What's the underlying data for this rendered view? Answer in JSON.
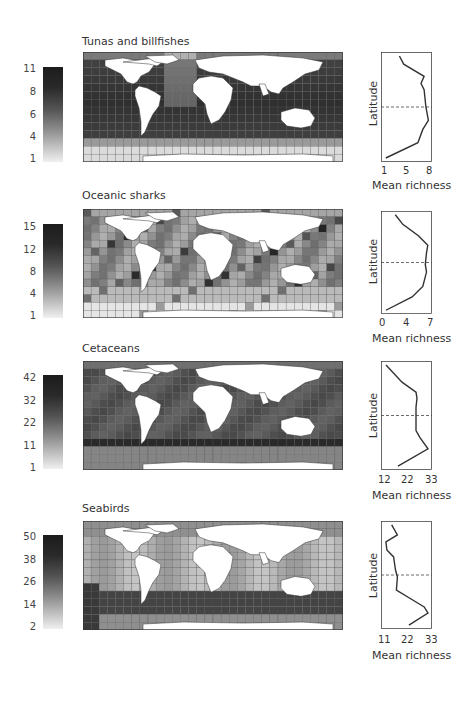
{
  "chart_data": [
    {
      "type": "heatmap",
      "title": "Tunas and billfishes",
      "colorbar": {
        "ticks": [
          "1",
          "4",
          "6",
          "8",
          "11"
        ],
        "min": 1,
        "max": 11
      },
      "profile": {
        "type": "line",
        "xlabel": "Mean richness",
        "ylabel": "Latitude",
        "xticks": [
          "1",
          "5",
          "8"
        ],
        "xlim": [
          1,
          8.3
        ],
        "equator_dashed": true,
        "points_north_to_south": [
          [
            3.5,
            0.0
          ],
          [
            4.2,
            0.08
          ],
          [
            7.5,
            0.2
          ],
          [
            7.0,
            0.27
          ],
          [
            7.5,
            0.33
          ],
          [
            7.8,
            0.5
          ],
          [
            8.2,
            0.63
          ],
          [
            7.3,
            0.72
          ],
          [
            6.5,
            0.85
          ],
          [
            1.3,
            1.0
          ]
        ]
      }
    },
    {
      "type": "heatmap",
      "title": "Oceanic sharks",
      "colorbar": {
        "ticks": [
          "1",
          "4",
          "8",
          "12",
          "15"
        ],
        "min": 1,
        "max": 15
      },
      "profile": {
        "type": "line",
        "xlabel": "Mean richness",
        "ylabel": "Latitude",
        "xticks": [
          "0",
          "4",
          "7"
        ],
        "xlim": [
          0,
          7.2
        ],
        "equator_dashed": true,
        "points_north_to_south": [
          [
            1.8,
            0.0
          ],
          [
            3.0,
            0.1
          ],
          [
            5.5,
            0.22
          ],
          [
            7.0,
            0.32
          ],
          [
            6.8,
            0.4
          ],
          [
            6.6,
            0.52
          ],
          [
            6.8,
            0.6
          ],
          [
            6.2,
            0.75
          ],
          [
            4.5,
            0.86
          ],
          [
            0.3,
            1.0
          ]
        ]
      }
    },
    {
      "type": "heatmap",
      "title": "Cetaceans",
      "colorbar": {
        "ticks": [
          "1",
          "11",
          "22",
          "32",
          "42"
        ],
        "min": 1,
        "max": 42
      },
      "profile": {
        "type": "line",
        "xlabel": "Mean richness",
        "ylabel": "Latitude",
        "xticks": [
          "12",
          "22",
          "33"
        ],
        "xlim": [
          11,
          33.5
        ],
        "equator_dashed": true,
        "points_north_to_south": [
          [
            12,
            0.0
          ],
          [
            20,
            0.17
          ],
          [
            27,
            0.27
          ],
          [
            27.5,
            0.33
          ],
          [
            27,
            0.42
          ],
          [
            27,
            0.65
          ],
          [
            29,
            0.72
          ],
          [
            33,
            0.83
          ],
          [
            18,
            1.0
          ]
        ]
      }
    },
    {
      "type": "heatmap",
      "title": "Seabirds",
      "colorbar": {
        "ticks": [
          "2",
          "14",
          "26",
          "38",
          "50"
        ],
        "min": 2,
        "max": 50
      },
      "profile": {
        "type": "line",
        "xlabel": "Mean richness",
        "ylabel": "Latitude",
        "xticks": [
          "11",
          "22",
          "33"
        ],
        "xlim": [
          10,
          33.5
        ],
        "equator_dashed": true,
        "points_north_to_south": [
          [
            14,
            0.0
          ],
          [
            17,
            0.1
          ],
          [
            11,
            0.17
          ],
          [
            11.5,
            0.25
          ],
          [
            15,
            0.32
          ],
          [
            16,
            0.45
          ],
          [
            17,
            0.52
          ],
          [
            16.5,
            0.65
          ],
          [
            25,
            0.75
          ],
          [
            31,
            0.82
          ],
          [
            33,
            0.88
          ],
          [
            23,
            1.0
          ]
        ]
      }
    }
  ],
  "panels": [
    {
      "title": "Tunas and billfishes",
      "cbar_ticks": [
        "11",
        "8",
        "6",
        "4",
        "1"
      ],
      "xticks": [
        "1",
        "5",
        "8"
      ],
      "xlabel": "Mean richness",
      "ylabel": "Latitude"
    },
    {
      "title": "Oceanic sharks",
      "cbar_ticks": [
        "15",
        "12",
        "8",
        "4",
        "1"
      ],
      "xticks": [
        "0",
        "4",
        "7"
      ],
      "xlabel": "Mean richness",
      "ylabel": "Latitude"
    },
    {
      "title": "Cetaceans",
      "cbar_ticks": [
        "42",
        "32",
        "22",
        "11",
        "1"
      ],
      "xticks": [
        "12",
        "22",
        "33"
      ],
      "xlabel": "Mean richness",
      "ylabel": "Latitude"
    },
    {
      "title": "Seabirds",
      "cbar_ticks": [
        "50",
        "38",
        "26",
        "14",
        "2"
      ],
      "xticks": [
        "11",
        "22",
        "33"
      ],
      "xlabel": "Mean richness",
      "ylabel": "Latitude"
    }
  ]
}
